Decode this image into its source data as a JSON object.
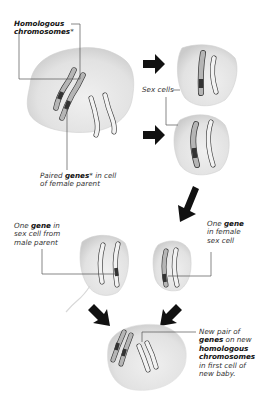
{
  "labels": {
    "homologous": {
      "line1": "Homologous",
      "line2": "chromosomes",
      "mark": "*"
    },
    "paired_genes": {
      "pre": "Paired ",
      "bold": "genes",
      "mark": "*",
      "post": " in cell",
      "line2": "of female parent"
    },
    "sex_cells": "Sex cells",
    "male_gene": {
      "pre": "One ",
      "bold": "gene",
      "post": " in",
      "line2": "sex cell from",
      "line3": "male parent"
    },
    "female_gene": {
      "pre": "One ",
      "bold": "gene",
      "line2": "in female",
      "line3": "sex cell"
    },
    "new_pair": {
      "line1": "New pair of",
      "bold1": "genes",
      "post1": " on new",
      "bold2": "homologous",
      "bold3": "chromosomes",
      "line5": "in first cell of",
      "line6": "new baby."
    }
  },
  "colors": {
    "cell_fill": "#e6e6e6",
    "cell_shade": "#cfcfcf",
    "chromosome_fill": "#b5b5b5",
    "chromosome_light": "#f2f2f2",
    "gene_band": "#333333",
    "arrow": "#111111",
    "leader_line": "#555555"
  }
}
